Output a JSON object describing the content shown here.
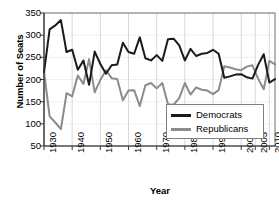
{
  "chart_data": {
    "type": "line",
    "title": "",
    "xlabel": "Year",
    "ylabel": "Number of Seats",
    "xlim": [
      1930,
      2012
    ],
    "ylim": [
      50,
      350
    ],
    "xticks": [
      1930,
      1940,
      1950,
      1960,
      1970,
      1980,
      1990,
      2000,
      2005,
      2010
    ],
    "xticklabels": [
      "1930",
      "1940",
      "1950",
      "1960",
      "1970",
      "1980",
      "1990",
      "2000",
      "2005",
      "2010"
    ],
    "yticks": [
      50,
      100,
      150,
      200,
      250,
      300,
      350
    ],
    "yticklabels": [
      "50",
      "100",
      "150",
      "200",
      "250",
      "300",
      "350"
    ],
    "grid": true,
    "legend_position": "lower-right",
    "x": [
      1930,
      1932,
      1934,
      1936,
      1938,
      1940,
      1942,
      1944,
      1946,
      1948,
      1950,
      1952,
      1954,
      1956,
      1958,
      1960,
      1962,
      1964,
      1966,
      1968,
      1970,
      1972,
      1974,
      1976,
      1978,
      1980,
      1982,
      1984,
      1986,
      1988,
      1990,
      1992,
      1994,
      1996,
      1998,
      2000,
      2002,
      2004,
      2006,
      2008,
      2010,
      2012
    ],
    "series": [
      {
        "name": "Democrats",
        "color": "#1a1a1a",
        "values": [
          216,
          313,
          322,
          334,
          262,
          267,
          222,
          243,
          188,
          263,
          235,
          213,
          232,
          234,
          283,
          262,
          258,
          295,
          248,
          243,
          255,
          242,
          291,
          292,
          277,
          243,
          269,
          253,
          258,
          260,
          267,
          258,
          204,
          207,
          211,
          212,
          205,
          202,
          233,
          257,
          193,
          201
        ]
      },
      {
        "name": "Republicans",
        "color": "#8c8c8c",
        "values": [
          218,
          117,
          103,
          88,
          169,
          162,
          209,
          190,
          246,
          171,
          199,
          221,
          203,
          201,
          153,
          175,
          176,
          140,
          187,
          192,
          180,
          192,
          144,
          143,
          158,
          192,
          166,
          182,
          177,
          175,
          167,
          176,
          230,
          227,
          223,
          221,
          229,
          232,
          202,
          178,
          242,
          234
        ]
      }
    ]
  },
  "legend": {
    "items": [
      {
        "label": "Democrats",
        "color": "#1a1a1a"
      },
      {
        "label": "Republicans",
        "color": "#8c8c8c"
      }
    ]
  }
}
